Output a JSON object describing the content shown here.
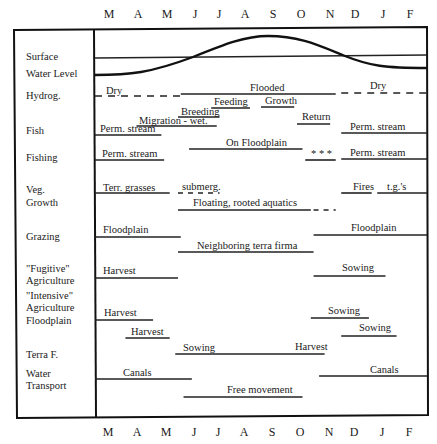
{
  "months": [
    "M",
    "A",
    "M",
    "J",
    "J",
    "A",
    "S",
    "O",
    "N",
    "D",
    "J",
    "F"
  ],
  "row_labels": [
    {
      "lines": [
        "Surface"
      ]
    },
    {
      "lines": [
        "Water Level"
      ]
    },
    {
      "lines": [
        "Hydrog."
      ]
    },
    {
      "lines": [
        "Fish"
      ]
    },
    {
      "lines": [
        "Fishing"
      ]
    },
    {
      "lines": [
        "Veg.",
        "Growth"
      ]
    },
    {
      "lines": [
        "Grazing"
      ]
    },
    {
      "lines": [
        "\"Fugitive\"",
        "Agriculture"
      ]
    },
    {
      "lines": [
        "\"Intensive\"",
        "Agriculture"
      ]
    },
    {
      "lines": [
        "Floodplain"
      ]
    },
    {
      "lines": [
        "Terra F."
      ]
    },
    {
      "lines": [
        "Water",
        "Transport"
      ]
    }
  ],
  "water_level": {
    "description": "Seasonal surface water level curve relative to surface line",
    "relative_level": {
      "M": -1,
      "A": 1,
      "M2": -0.5,
      "J": 0,
      "J2": 0.7,
      "S": 1,
      "O": 0.7,
      "N": 0,
      "D": -0.6,
      "J3": -0.7,
      "F": -0.7
    }
  },
  "events": [
    {
      "row": "Hydrog.",
      "label": "Dry",
      "start": 0,
      "end": 3.1,
      "style": "dashed"
    },
    {
      "row": "Hydrog.",
      "label": "Flooded",
      "start": 3.1,
      "end": 8.7,
      "style": "solid"
    },
    {
      "row": "Hydrog.",
      "label": "Dry",
      "start": 8.9,
      "end": 12,
      "style": "dashed"
    },
    {
      "row": "Fish",
      "label": "Feeding",
      "start": 4.2,
      "end": 5.6,
      "style": "solid"
    },
    {
      "row": "Fish",
      "label": "Growth",
      "start": 6.0,
      "end": 7.2,
      "style": "solid"
    },
    {
      "row": "Fish",
      "label": "Breeding",
      "start": 3.0,
      "end": 4.5,
      "style": "solid"
    },
    {
      "row": "Fish",
      "label": "Migration - wet.",
      "start": 1.5,
      "end": 4.4,
      "style": "solid"
    },
    {
      "row": "Fish",
      "label": "Return",
      "start": 7.3,
      "end": 8.5,
      "style": "solid"
    },
    {
      "row": "Fish",
      "label": "Perm. stream",
      "start": 0,
      "end": 2.4,
      "style": "solid"
    },
    {
      "row": "Fish",
      "label": "Perm. stream",
      "start": 8.9,
      "end": 12,
      "style": "solid"
    },
    {
      "row": "Fishing",
      "label": "On Floodplain",
      "start": 3.4,
      "end": 7.5,
      "style": "solid"
    },
    {
      "row": "Fishing",
      "label": "Perm. stream",
      "start": 0,
      "end": 2.5,
      "style": "solid"
    },
    {
      "row": "Fishing",
      "label": "* * *",
      "start": 7.6,
      "end": 8.7,
      "style": "solid"
    },
    {
      "row": "Fishing",
      "label": "Perm. stream",
      "start": 8.9,
      "end": 12,
      "style": "solid"
    },
    {
      "row": "Veg. Growth",
      "label": "Terr. grasses",
      "start": 0,
      "end": 2.7,
      "style": "solid"
    },
    {
      "row": "Veg. Growth",
      "label": "submerg.",
      "start": 3.0,
      "end": 4.5,
      "style": "dashed"
    },
    {
      "row": "Veg. Growth",
      "label": "Fires",
      "start": 8.9,
      "end": 10.0,
      "style": "solid"
    },
    {
      "row": "Veg. Growth",
      "label": "t.g.'s",
      "start": 10.2,
      "end": 12,
      "style": "solid"
    },
    {
      "row": "Veg. Growth",
      "label": "Floating, rooted aquatics",
      "start": 3.0,
      "end": 7.8,
      "style": "solid"
    },
    {
      "row": "Veg. Growth",
      "label": "",
      "start": 7.9,
      "end": 8.7,
      "style": "dashed"
    },
    {
      "row": "Grazing",
      "label": "Floodplain",
      "start": 0,
      "end": 3.1,
      "style": "solid"
    },
    {
      "row": "Grazing",
      "label": "Floodplain",
      "start": 7.9,
      "end": 12,
      "style": "solid"
    },
    {
      "row": "Grazing",
      "label": "Neighboring terra firma",
      "start": 3.0,
      "end": 7.9,
      "style": "solid"
    },
    {
      "row": "\"Fugitive\" Agriculture",
      "label": "Harvest",
      "start": 0,
      "end": 3.0,
      "style": "solid"
    },
    {
      "row": "\"Fugitive\" Agriculture",
      "label": "Sowing",
      "start": 7.9,
      "end": 10.5,
      "style": "solid"
    },
    {
      "row": "\"Intensive\" Agriculture",
      "label": "Harvest",
      "start": 0,
      "end": 2.1,
      "style": "solid"
    },
    {
      "row": "\"Intensive\" Agriculture",
      "label": "Sowing",
      "start": 7.8,
      "end": 9.9,
      "style": "solid"
    },
    {
      "row": "Floodplain",
      "label": "Harvest",
      "start": 1.1,
      "end": 2.7,
      "style": "solid"
    },
    {
      "row": "Floodplain",
      "label": "Sowing",
      "start": 8.9,
      "end": 10.9,
      "style": "solid"
    },
    {
      "row": "Terra F.",
      "label": "Sowing",
      "start": 2.9,
      "end": 8.3,
      "style": "solid",
      "end_label": "Harvest"
    },
    {
      "row": "Water Transport",
      "label": "Canals",
      "start": 0,
      "end": 3.5,
      "style": "solid"
    },
    {
      "row": "Water Transport",
      "label": "Canals",
      "start": 8.1,
      "end": 12,
      "style": "solid"
    },
    {
      "row": "Water Transport",
      "label": "Free movement",
      "start": 3.2,
      "end": 7.5,
      "style": "solid"
    }
  ]
}
